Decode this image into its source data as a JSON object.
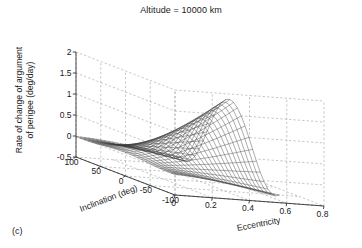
{
  "figure": {
    "title": "Altitude = 10000 km",
    "panel_label": "(c)",
    "background_color": "#ffffff",
    "mesh_color": "#3a3a3a",
    "grid_color": "#9a9a9a",
    "axis_color": "#333333"
  },
  "chart_data": {
    "type": "surface",
    "title": "Altitude = 10000 km",
    "xlabel": "Inclination (deg)",
    "ylabel": "Eccentricity",
    "zlabel": "Rate of change of argument of perigee (deg/day)",
    "xlim": [
      -100,
      100
    ],
    "ylim": [
      0,
      0.8
    ],
    "zlim": [
      -0.5,
      2
    ],
    "xticks": [
      100,
      50,
      0,
      -50,
      -100
    ],
    "xticklabels": [
      "100",
      "50",
      "0",
      "-50",
      "-100"
    ],
    "yticks": [
      0,
      0.2,
      0.4,
      0.6,
      0.8
    ],
    "yticklabels": [
      "0",
      "0.2",
      "0.4",
      "0.6",
      "0.8"
    ],
    "zticks": [
      -0.5,
      0,
      0.5,
      1,
      1.5,
      2
    ],
    "zticklabels": [
      "-0.5",
      "0",
      "0.5",
      "1",
      "1.5",
      "2"
    ],
    "grid": true,
    "legend": false,
    "mesh_nx": 26,
    "mesh_ny": 26,
    "x_range_data": [
      -100,
      100
    ],
    "y_range_data": [
      0.0,
      0.56
    ],
    "peak_value": 1.8,
    "peak_at": {
      "inclination": 0,
      "eccentricity": 0.42
    },
    "min_value": -0.45,
    "zticklabel_positions": [
      "2",
      "1.5",
      "1",
      "0.5",
      "0",
      "-0.5"
    ],
    "axis_tick_count": {
      "x": 5,
      "y": 5,
      "z": 6
    }
  }
}
